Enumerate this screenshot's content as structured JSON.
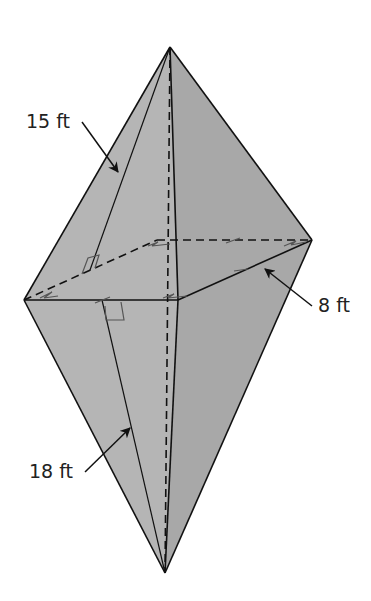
{
  "figure": {
    "colors": {
      "background": "#ffffff",
      "face_left": "#b5b5b5",
      "face_right": "#a8a8a8",
      "edge": "#111111",
      "marks": "#555555"
    },
    "labels": {
      "top_slant": "15 ft",
      "base_side": "8 ft",
      "bottom_slant": "18 ft"
    }
  }
}
